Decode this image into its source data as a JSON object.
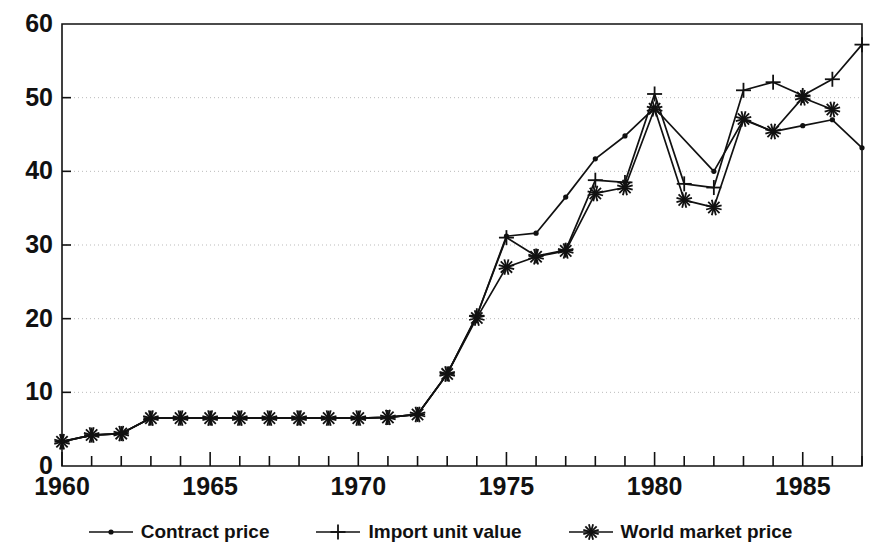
{
  "chart_data": {
    "type": "line",
    "title": "",
    "xlabel": "",
    "ylabel": "",
    "xlim": [
      1960,
      1987
    ],
    "ylim": [
      0,
      60
    ],
    "grid": true,
    "grid_axis": "y",
    "legend_position": "bottom",
    "y_ticks": [
      0,
      10,
      20,
      30,
      40,
      50,
      60
    ],
    "y_tick_labels": [
      "0",
      "10",
      "20",
      "30",
      "40",
      "50",
      "60"
    ],
    "x_ticks": [
      1960,
      1965,
      1970,
      1975,
      1980,
      1985
    ],
    "x_tick_labels": [
      "1960",
      "1965",
      "1970",
      "1975",
      "1980",
      "1985"
    ],
    "x_minor_tick_interval": 1,
    "x": [
      1960,
      1961,
      1962,
      1963,
      1964,
      1965,
      1966,
      1967,
      1968,
      1969,
      1970,
      1971,
      1972,
      1973,
      1974,
      1975,
      1976,
      1977,
      1978,
      1979,
      1980,
      1981,
      1982,
      1983,
      1984,
      1985,
      1986,
      1987
    ],
    "series": [
      {
        "name": "Contract price",
        "marker": "dot",
        "values": [
          3.3,
          4.2,
          4.4,
          6.5,
          6.5,
          6.5,
          6.5,
          6.5,
          6.5,
          6.5,
          6.5,
          6.6,
          7.0,
          12.5,
          20.4,
          31.2,
          31.6,
          36.5,
          41.7,
          44.8,
          48.6,
          null,
          40.0,
          47.0,
          45.4,
          46.2,
          47.0,
          43.2
        ]
      },
      {
        "name": "Import unit value",
        "marker": "plus",
        "values": [
          3.3,
          4.2,
          4.4,
          6.5,
          6.5,
          6.5,
          6.5,
          6.5,
          6.5,
          6.5,
          6.5,
          6.6,
          7.0,
          12.5,
          20.4,
          31.0,
          28.5,
          29.3,
          38.8,
          38.5,
          50.5,
          38.3,
          37.8,
          51.0,
          52.1,
          50.3,
          52.5,
          57.2
        ]
      },
      {
        "name": "World market price",
        "marker": "asterisk",
        "values": [
          3.3,
          4.2,
          4.4,
          6.5,
          6.5,
          6.5,
          6.5,
          6.5,
          6.5,
          6.5,
          6.5,
          6.6,
          7.0,
          12.5,
          20.1,
          27.0,
          28.4,
          29.2,
          37.0,
          37.8,
          48.5,
          36.1,
          35.1,
          47.1,
          45.4,
          50.0,
          48.4,
          null
        ]
      }
    ]
  },
  "legend": {
    "items": [
      {
        "label": "Contract price",
        "marker": "dot"
      },
      {
        "label": "Import unit value",
        "marker": "plus"
      },
      {
        "label": "World market price",
        "marker": "asterisk"
      }
    ]
  },
  "colors": {
    "line": "#111111",
    "axis": "#111111",
    "grid": "#bbbbbb",
    "background": "#ffffff",
    "text": "#111111"
  }
}
